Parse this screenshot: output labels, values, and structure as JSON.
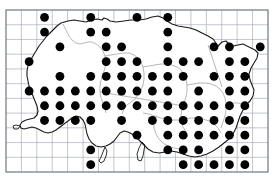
{
  "figure": {
    "kind": "distribution-dot-map",
    "title_remnant": "distribution map",
    "colors": {
      "background": "#ffffff",
      "grid_line": "#9aa0b0",
      "frame": "#6f7684",
      "coastline": "#1a1a1a",
      "parish_boundary": "#7a7a7a",
      "dot_fill": "#000000"
    }
  },
  "grid": {
    "frame": {
      "x": 6,
      "y": 10,
      "width": 262,
      "height": 162
    },
    "cell_width": 15.41,
    "cell_height": 14.73,
    "columns": 17,
    "rows": 11,
    "show_grid": true
  },
  "dots": {
    "radius": 4.4,
    "count": 94,
    "cells": [
      [
        2,
        0
      ],
      [
        5,
        0
      ],
      [
        8,
        0
      ],
      [
        10,
        0
      ],
      [
        2,
        1
      ],
      [
        5,
        1
      ],
      [
        6,
        1
      ],
      [
        10,
        1
      ],
      [
        3,
        2
      ],
      [
        6,
        2
      ],
      [
        7,
        2
      ],
      [
        10,
        2
      ],
      [
        13,
        2
      ],
      [
        14,
        2
      ],
      [
        16,
        2
      ],
      [
        1,
        3
      ],
      [
        6,
        3
      ],
      [
        7,
        3
      ],
      [
        8,
        3
      ],
      [
        10,
        3
      ],
      [
        11,
        3
      ],
      [
        12,
        3
      ],
      [
        14,
        3
      ],
      [
        15,
        3
      ],
      [
        3,
        4
      ],
      [
        5,
        4
      ],
      [
        6,
        4
      ],
      [
        7,
        4
      ],
      [
        8,
        4
      ],
      [
        9,
        4
      ],
      [
        10,
        4
      ],
      [
        11,
        4
      ],
      [
        13,
        4
      ],
      [
        14,
        4
      ],
      [
        15,
        4
      ],
      [
        1,
        5
      ],
      [
        2,
        5
      ],
      [
        3,
        5
      ],
      [
        4,
        5
      ],
      [
        5,
        5
      ],
      [
        6,
        5
      ],
      [
        7,
        5
      ],
      [
        8,
        5
      ],
      [
        9,
        5
      ],
      [
        10,
        5
      ],
      [
        12,
        5
      ],
      [
        14,
        5
      ],
      [
        15,
        5
      ],
      [
        2,
        6
      ],
      [
        3,
        6
      ],
      [
        4,
        6
      ],
      [
        5,
        6
      ],
      [
        6,
        6
      ],
      [
        7,
        6
      ],
      [
        8,
        6
      ],
      [
        9,
        6
      ],
      [
        10,
        6
      ],
      [
        11,
        6
      ],
      [
        12,
        6
      ],
      [
        13,
        6
      ],
      [
        14,
        6
      ],
      [
        15,
        6
      ],
      [
        2,
        7
      ],
      [
        3,
        7
      ],
      [
        4,
        7
      ],
      [
        5,
        7
      ],
      [
        7,
        7
      ],
      [
        9,
        7
      ],
      [
        10,
        7
      ],
      [
        11,
        7
      ],
      [
        12,
        7
      ],
      [
        13,
        7
      ],
      [
        14,
        7
      ],
      [
        15,
        7
      ],
      [
        8,
        8
      ],
      [
        10,
        8
      ],
      [
        11,
        8
      ],
      [
        12,
        8
      ],
      [
        13,
        8
      ],
      [
        14,
        8
      ],
      [
        15,
        8
      ],
      [
        5,
        9
      ],
      [
        10,
        9
      ],
      [
        11,
        9
      ],
      [
        12,
        9
      ],
      [
        14,
        9
      ],
      [
        15,
        9
      ],
      [
        5,
        10
      ],
      [
        11,
        10
      ],
      [
        14,
        10
      ],
      [
        15,
        10
      ],
      [
        13,
        10
      ],
      [
        12,
        10
      ]
    ]
  },
  "coastline": {
    "name": "island-outline",
    "path": "M 61 23 L 68 21 L 74 20 L 80 21 L 86 22 L 92 20 L 97 19 L 102 20 L 104 18 L 107 19 L 110 21 L 116 22 L 124 21 L 131 20 L 139 20 L 146 19 L 152 17 L 158 16 L 163 18 L 167 21 L 172 24 L 178 26 L 184 27 L 190 28 L 196 30 L 202 33 L 208 36 L 213 39 L 216 43 L 217 47 L 219 45 L 222 42 L 226 41 L 229 44 L 233 46 L 238 45 L 243 44 L 247 46 L 251 48 L 255 50 L 258 53 L 257 58 L 254 63 L 251 68 L 249 74 L 250 80 L 252 85 L 254 90 L 253 96 L 250 101 L 246 105 L 243 110 L 240 116 L 238 122 L 236 128 L 233 134 L 229 139 L 224 143 L 219 147 L 213 151 L 207 154 L 201 156 L 195 157 L 189 156 L 183 154 L 177 152 L 171 151 L 165 152 L 159 153 L 153 152 L 148 149 L 144 145 L 140 141 L 136 137 L 132 134 L 128 132 L 124 131 L 120 133 L 117 137 L 114 141 L 110 144 L 106 146 L 101 147 L 96 146 L 92 143 L 89 139 L 87 134 L 86 129 L 85 124 L 83 120 L 80 117 L 76 116 L 72 118 L 68 121 L 64 124 L 60 127 L 56 130 L 52 132 L 48 133 L 44 132 L 40 130 L 36 128 L 32 127 L 28 128 L 24 129 L 21 128 L 20 125 L 22 122 L 26 120 L 30 119 L 34 118 L 37 115 L 38 111 L 37 106 L 35 101 L 33 96 L 31 91 L 29 86 L 28 81 L 27 76 L 27 71 L 28 66 L 30 61 L 33 56 L 36 51 L 39 46 L 43 41 L 47 36 L 52 31 L 57 26 Z",
    "inlet_path": "M 20 126 L 16 125 L 13 126 L 14 129 L 18 129 Z",
    "bay_path": "M 105 147 L 103 152 L 101 157 L 99 161 L 101 163 L 104 161 L 106 156 L 107 151 Z",
    "lagoon_path": "M 142 142 L 139 148 L 137 154 L 138 160 L 141 161 L 143 156 L 144 150 L 145 145 Z"
  },
  "boundaries": {
    "name": "parish-boundaries",
    "paths": [
      "M 63 24 L 66 30 L 69 36 L 72 40 L 76 43 L 80 44 L 84 43 L 88 42 L 92 42 L 96 44 L 100 47 L 103 51 L 105 56 L 106 62 L 105 68 L 103 74 L 101 80 L 100 86 L 100 92 L 101 98 L 103 103 L 105 108 L 106 113",
      "M 105 56 L 111 55 L 117 54 L 123 53 L 129 53 L 134 55 L 138 58 L 141 62 L 143 67 L 144 73 L 144 79 L 143 85 L 141 90 L 138 95 L 135 99 L 131 102 L 127 105 L 124 109 L 122 114",
      "M 143 67 L 149 66 L 155 65 L 161 64 L 167 64 L 172 65 L 177 67 L 181 70 L 184 74 L 186 79 L 187 85 L 187 91 L 186 97 L 184 103 L 182 109 L 181 115 L 181 121 L 183 127 L 186 132",
      "M 187 85 L 193 84 L 199 83 L 205 83 L 211 84 L 216 86 L 220 89 L 223 93 L 225 98 L 226 104 L 226 110 L 225 116 L 223 122 L 221 128",
      "M 100 92 L 106 93 L 112 94 L 118 95 L 124 96 L 130 97 L 136 98 L 142 99 L 148 100 L 154 101 L 160 102 L 166 103 L 172 104 L 178 105 L 184 105",
      "M 143 113 L 149 114 L 155 116 L 161 118 L 167 119 L 173 120 L 179 120 L 185 119 L 191 118 L 197 118 L 203 119 L 209 121 L 214 124 L 218 128 L 221 133",
      "M 155 116 L 154 122 L 154 128 L 156 134 L 159 139 L 163 143 L 168 146 L 174 148 L 180 149 L 186 149",
      "M 208 45 L 210 51 L 212 57 L 214 63 L 216 69 L 218 75 L 220 81 L 222 87",
      "M 226 104 L 232 103 L 238 103 L 244 104 L 249 106"
    ]
  }
}
